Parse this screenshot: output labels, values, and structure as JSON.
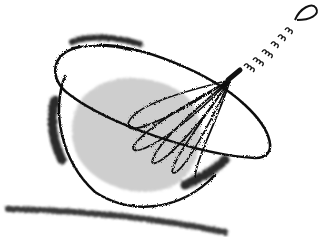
{
  "illustration": {
    "subject": "whisk in mixing bowl",
    "style": "black ink line drawing with charcoal smudges",
    "colors": {
      "background": "#ffffff",
      "ink": "#111111",
      "fill": "#c8c8c8",
      "smudge": "#2a2a2a"
    },
    "elements": [
      "bowl",
      "bowl-rim",
      "batter-fill",
      "whisk-wires",
      "whisk-handle-coil",
      "whisk-loop",
      "ground-shadow"
    ]
  }
}
